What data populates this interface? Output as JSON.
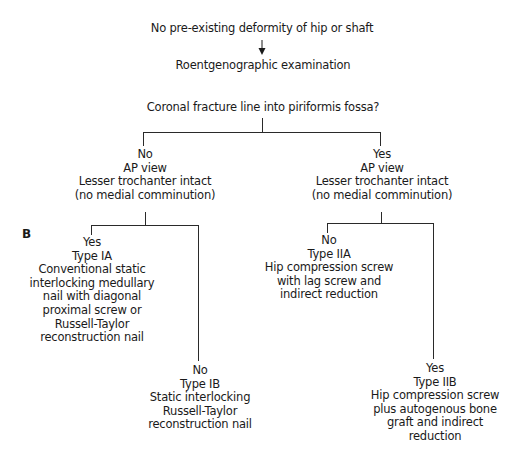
{
  "diagram": {
    "panel_label": "B",
    "start": "No pre-existing deformity of hip or shaft",
    "step1": "Roentgenographic examination",
    "question1": "Coronal fracture line into piriformis fossa?",
    "branches": [
      {
        "answer": "No",
        "lines": [
          "No",
          "AP view",
          "Lesser trochanter intact",
          "(no medial comminution)"
        ],
        "children": [
          {
            "lines": [
              "Yes",
              "Type IA",
              "Conventional static",
              "interlocking medullary",
              "nail with diagonal",
              "proximal screw or",
              "Russell-Taylor",
              "reconstruction nail"
            ]
          },
          {
            "lines": [
              "No",
              "Type IB",
              "Static interlocking",
              "Russell-Taylor",
              "reconstruction nail"
            ]
          }
        ]
      },
      {
        "answer": "Yes",
        "lines": [
          "Yes",
          "AP view",
          "Lesser trochanter intact",
          "(no medial comminution)"
        ],
        "children": [
          {
            "lines": [
              "No",
              "Type IIA",
              "Hip compression screw",
              "with lag screw and",
              "indirect reduction"
            ]
          },
          {
            "lines": [
              "Yes",
              "Type IIB",
              "Hip compression screw",
              "plus autogenous bone",
              "graft and indirect",
              "reduction"
            ]
          }
        ]
      }
    ]
  }
}
